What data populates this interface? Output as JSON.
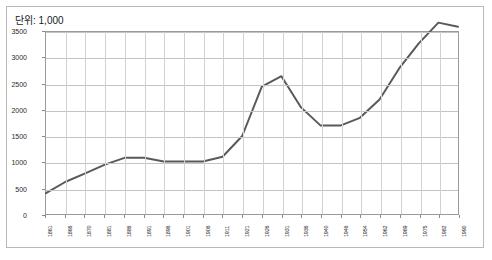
{
  "chart_title": "단위: 1,000",
  "chart_data": {
    "type": "line",
    "title": "단위: 1,000",
    "xlabel": "",
    "ylabel": "",
    "ylim": [
      0,
      3500
    ],
    "ytick_step": 500,
    "ytick_labels": [
      "0",
      "500",
      "1000",
      "1500",
      "2000",
      "2500",
      "3000",
      "3500"
    ],
    "ytick_values": [
      0,
      500,
      1000,
      1500,
      2000,
      2500,
      3000,
      3500
    ],
    "grid": true,
    "legend": "none",
    "line_color": "#595959",
    "categories": [
      "1861",
      "1866",
      "1870",
      "1881",
      "1886",
      "1891",
      "1896",
      "1901",
      "1906",
      "1911",
      "1921",
      "1926",
      "1931",
      "1936",
      "1940",
      "1946",
      "1954",
      "1962",
      "1969",
      "1975",
      "1982",
      "1990"
    ],
    "values": [
      400,
      620,
      780,
      950,
      1080,
      1080,
      1010,
      1010,
      1010,
      1100,
      1500,
      2450,
      2650,
      2050,
      1700,
      1700,
      1850,
      2200,
      2800,
      3280,
      3680,
      3600
    ],
    "series": [
      {
        "name": "series-1",
        "values": [
          400,
          620,
          780,
          950,
          1080,
          1080,
          1010,
          1010,
          1010,
          1100,
          1500,
          2450,
          2650,
          2050,
          1700,
          1700,
          1850,
          2200,
          2800,
          3280,
          3680,
          3600
        ]
      }
    ]
  }
}
